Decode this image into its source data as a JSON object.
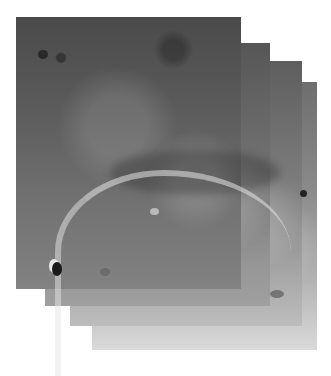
{
  "image": {
    "subject": "planetary-surface-mosaic",
    "frames": [
      {
        "label": "frame-1",
        "left": 16,
        "top": 17,
        "width": 225,
        "height": 272
      },
      {
        "label": "frame-2",
        "left": 45,
        "top": 43,
        "width": 225,
        "height": 263
      },
      {
        "label": "frame-3",
        "left": 70,
        "top": 61,
        "width": 232,
        "height": 265
      },
      {
        "label": "frame-4",
        "left": 92,
        "top": 82,
        "width": 225,
        "height": 268
      }
    ],
    "caption": ""
  }
}
